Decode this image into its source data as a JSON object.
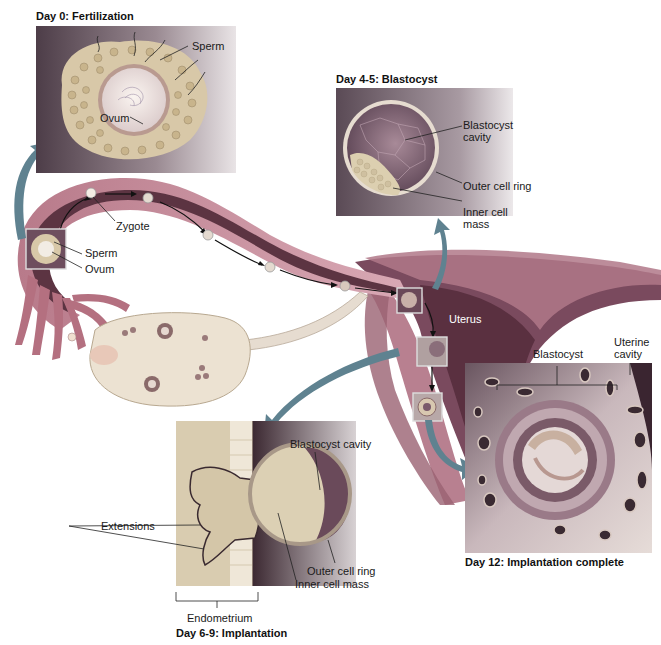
{
  "figure": {
    "stages": [
      {
        "title": "Day 0: Fertilization",
        "labels": [
          "Sperm",
          "Ovum"
        ]
      },
      {
        "title": "Day 4-5: Blastocyst",
        "labels": [
          "Blastocyst\ncavity",
          "Outer cell ring",
          "Inner cell\nmass"
        ]
      },
      {
        "title": "Day 6-9: Implantation",
        "labels": [
          "Blastocyst cavity",
          "Extensions",
          "Outer cell ring",
          "Inner cell mass",
          "Endometrium"
        ]
      },
      {
        "title": "Day 12: Implantation complete",
        "labels": [
          "Blastocyst",
          "Uterine\ncavity"
        ]
      }
    ],
    "overview_labels": {
      "zygote": "Zygote",
      "sperm": "Sperm",
      "ovum": "Ovum",
      "uterus": "Uterus"
    }
  },
  "colors": {
    "tube_outer": "#c98a9a",
    "tube_inner": "#6b3a4a",
    "ovary": "#e8dcc8",
    "uterus_wall": "#8a5a6a",
    "uterus_cavity": "#4a2a35",
    "cell_fill": "#d8c8a8",
    "inset_bg": "#5a4a55",
    "arrow": "#6b8a96"
  }
}
